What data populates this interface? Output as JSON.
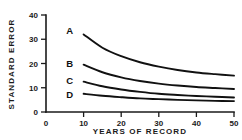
{
  "chart_data": {
    "type": "line",
    "title": "",
    "xlabel": "YEARS OF RECORD",
    "ylabel": "STANDARD ERROR",
    "xlim": [
      0,
      50
    ],
    "ylim": [
      0,
      40
    ],
    "xticks": [
      0,
      10,
      20,
      30,
      40,
      50
    ],
    "yticks": [
      0,
      10,
      20,
      30,
      40
    ],
    "xtick_labels": [
      "0",
      "10",
      "20",
      "30",
      "40",
      "50"
    ],
    "ytick_labels": [
      "0",
      "10",
      "20",
      "30",
      "40"
    ],
    "grid": false,
    "legend": "inline-curve-labels",
    "x": [
      10,
      15,
      20,
      25,
      30,
      35,
      40,
      45,
      50
    ],
    "series": [
      {
        "name": "A",
        "label": "A",
        "color": "#111111",
        "values": [
          32.0,
          26.5,
          23.0,
          20.5,
          18.7,
          17.3,
          16.3,
          15.6,
          15.0
        ]
      },
      {
        "name": "B",
        "label": "B",
        "color": "#111111",
        "values": [
          19.5,
          16.4,
          14.3,
          12.8,
          11.7,
          10.9,
          10.3,
          9.9,
          9.5
        ]
      },
      {
        "name": "C",
        "label": "C",
        "color": "#111111",
        "values": [
          12.5,
          10.6,
          9.3,
          8.3,
          7.5,
          7.0,
          6.6,
          6.3,
          6.0
        ]
      },
      {
        "name": "D",
        "label": "D",
        "color": "#111111",
        "values": [
          7.5,
          6.7,
          6.1,
          5.6,
          5.3,
          5.0,
          4.8,
          4.6,
          4.5
        ]
      }
    ]
  }
}
